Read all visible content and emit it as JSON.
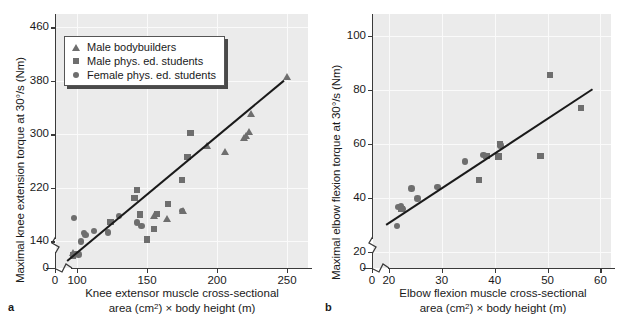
{
  "chart_data": [
    {
      "type": "scatter",
      "panel": "a",
      "panel_letter": "a",
      "title": "",
      "ylabel": "Maximal knee extension torque at 30°/s (Nm)",
      "xlabel_line1": "Knee extensor muscle cross-sectional",
      "xlabel_line2_pre": "area (cm",
      "xlabel_line2_sup": "2",
      "xlabel_line2_post": ") × body height (m)",
      "xticks": [
        0,
        100,
        150,
        200,
        250
      ],
      "yticks": [
        0,
        140,
        220,
        300,
        380,
        460
      ],
      "xlim": [
        85,
        265
      ],
      "ylim": [
        100,
        480
      ],
      "axis_break_x": true,
      "axis_break_y": true,
      "grid": true,
      "legend_position": "top-left",
      "legend": [
        {
          "label": "Male bodybuilders",
          "marker": "triangle"
        },
        {
          "label": "Male phys. ed. students",
          "marker": "square"
        },
        {
          "label": "Female phys. ed. students",
          "marker": "circle"
        }
      ],
      "series": [
        {
          "name": "Female phys. ed. students",
          "marker": "circle",
          "points": [
            [
              98,
              175
            ],
            [
              99,
              121
            ],
            [
              101,
              120
            ],
            [
              103,
              140
            ],
            [
              105,
              152
            ],
            [
              106,
              149
            ],
            [
              112,
              155
            ],
            [
              122,
              153
            ],
            [
              130,
              178
            ],
            [
              143,
              168
            ],
            [
              146,
              163
            ],
            [
              175,
              185
            ]
          ]
        },
        {
          "name": "Male phys. ed. students",
          "marker": "square",
          "points": [
            [
              97,
              119
            ],
            [
              124,
              169
            ],
            [
              141,
              205
            ],
            [
              143,
              217
            ],
            [
              145,
              180
            ],
            [
              150,
              143
            ],
            [
              155,
              158
            ],
            [
              157,
              181
            ],
            [
              165,
              196
            ],
            [
              175,
              232
            ],
            [
              179,
              266
            ],
            [
              181,
              302
            ]
          ]
        },
        {
          "name": "Male bodybuilders",
          "marker": "triangle",
          "points": [
            [
              97,
              122
            ],
            [
              155,
              178
            ],
            [
              164,
              174
            ],
            [
              176,
              185
            ],
            [
              193,
              282
            ],
            [
              206,
              274
            ],
            [
              219,
              295
            ],
            [
              221,
              297
            ],
            [
              223,
              303
            ],
            [
              224,
              330
            ],
            [
              250,
              386
            ]
          ]
        }
      ],
      "fit_line": {
        "x1": 93,
        "y1": 112,
        "x2": 248,
        "y2": 382
      }
    },
    {
      "type": "scatter",
      "panel": "b",
      "panel_letter": "b",
      "title": "",
      "ylabel": "Maximal elbow flexion torque at 30°/s (Nm)",
      "xlabel_line1": "Elbow flexion muscle cross-sectional",
      "xlabel_line2_pre": "area (cm",
      "xlabel_line2_sup": "2",
      "xlabel_line2_post": ") × body height (m)",
      "xticks": [
        0,
        20,
        30,
        40,
        50,
        60
      ],
      "yticks": [
        0,
        20,
        40,
        60,
        80,
        100
      ],
      "xlim": [
        17,
        62
      ],
      "ylim": [
        14,
        108
      ],
      "axis_break_x": true,
      "axis_break_y": true,
      "grid": true,
      "legend_position": "none",
      "series": [
        {
          "name": "Female phys. ed. students",
          "marker": "circle",
          "points": [
            [
              21.5,
              29.5
            ],
            [
              21.8,
              36.5
            ],
            [
              22.3,
              37.0
            ],
            [
              22.6,
              35.8
            ],
            [
              24.3,
              43.5
            ],
            [
              25.4,
              39.8
            ],
            [
              29.2,
              44.0
            ],
            [
              34.4,
              53.5
            ],
            [
              37.9,
              55.8
            ],
            [
              41.1,
              59.3
            ]
          ]
        },
        {
          "name": "Male phys. ed. students",
          "marker": "square",
          "points": [
            [
              22.4,
              35.8
            ],
            [
              37.0,
              46.5
            ],
            [
              38.5,
              55.5
            ],
            [
              40.7,
              55.3
            ],
            [
              41.0,
              59.8
            ],
            [
              48.7,
              55.5
            ],
            [
              50.5,
              85.5
            ],
            [
              56.3,
              73.3
            ]
          ]
        }
      ],
      "fit_line": {
        "x1": 19.5,
        "y1": 30.3,
        "x2": 58.5,
        "y2": 80.5
      }
    }
  ]
}
